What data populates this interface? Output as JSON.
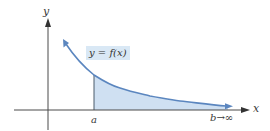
{
  "figure": {
    "axes": {
      "x_label": "x",
      "y_label": "y"
    },
    "curve_label": "y = f(x)",
    "lower_bound_label": "a",
    "upper_bound_label": "b→∞",
    "colors": {
      "curve": "#5b86bf",
      "fill": "#cfe0f2",
      "label_bg": "#d9e8f5",
      "axis": "#4a4a4a"
    }
  }
}
